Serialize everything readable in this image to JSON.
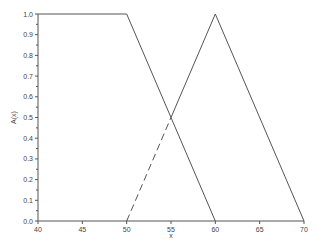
{
  "chart_data": {
    "type": "line",
    "title": "",
    "xlabel": "x",
    "ylabel": "A(x)",
    "xlim": [
      40,
      70
    ],
    "ylim": [
      0,
      1.0
    ],
    "grid": false,
    "x_ticks": [
      "40",
      "45",
      "50",
      "55",
      "60",
      "65",
      "70"
    ],
    "y_ticks": [
      "0.0",
      "0.1",
      "0.2",
      "0.3",
      "0.4",
      "0.5",
      "0.6",
      "0.7",
      "0.8",
      "0.9",
      "1.0"
    ],
    "series": [
      {
        "name": "trapezoid",
        "style": "solid",
        "x": [
          40,
          50,
          60
        ],
        "y": [
          1.0,
          1.0,
          0.0
        ]
      },
      {
        "name": "triangle-upper",
        "style": "solid",
        "x": [
          55,
          60,
          70
        ],
        "y": [
          0.5,
          1.0,
          0.0
        ]
      },
      {
        "name": "triangle-lower-left",
        "style": "dashed",
        "x": [
          50,
          55
        ],
        "y": [
          0.0,
          0.5
        ]
      }
    ],
    "colors": {
      "line": "#555555",
      "axis": "#555555"
    }
  }
}
